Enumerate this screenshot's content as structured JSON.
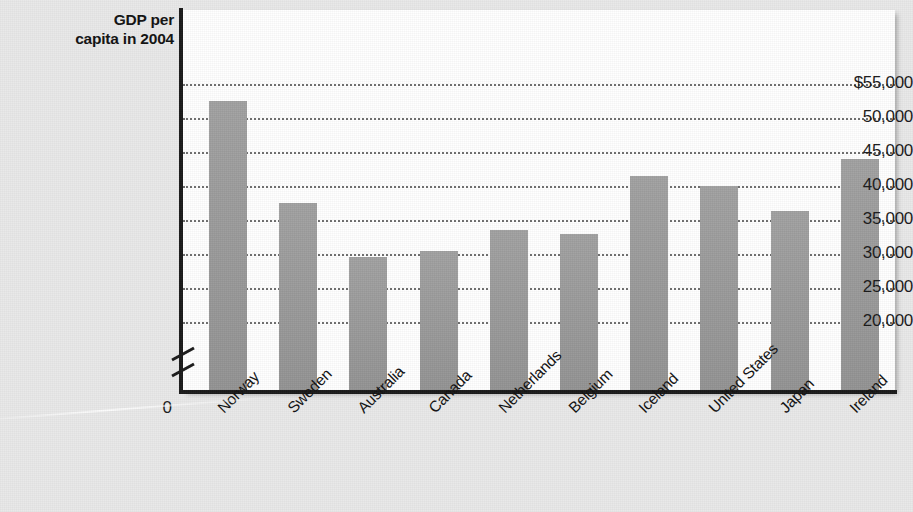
{
  "chart": {
    "title": "",
    "axis_title_line1": "GDP per",
    "axis_title_line2": "capita in 2004",
    "zero_label": "0",
    "bar_color": "#9b9b9b",
    "plot_background": "#ffffff",
    "page_background": "#e9e9e9",
    "gridline_color": "#6e6e6e",
    "axis_color": "#1a1a1a"
  },
  "chart_data": {
    "type": "bar",
    "title": "GDP per capita in 2004",
    "xlabel": "",
    "ylabel": "GDP per capita in 2004",
    "ylim": [
      20000,
      55000
    ],
    "y_axis_broken": true,
    "y_break_below": 20000,
    "grid": true,
    "grid_axis": "y",
    "legend": "none",
    "tick_labels": [
      "$55,000",
      "50,000",
      "45,000",
      "40,000",
      "35,000",
      "30,000",
      "25,000",
      "20,000"
    ],
    "tick_values": [
      55000,
      50000,
      45000,
      40000,
      35000,
      30000,
      25000,
      20000
    ],
    "categories": [
      "Norway",
      "Sweden",
      "Australia",
      "Canada",
      "Netherlands",
      "Belgium",
      "Iceland",
      "United States",
      "Japan",
      "Ireland"
    ],
    "values": [
      52500,
      37500,
      29500,
      30500,
      33500,
      33000,
      41500,
      40000,
      36300,
      44000
    ],
    "value_unit": "US dollars"
  }
}
